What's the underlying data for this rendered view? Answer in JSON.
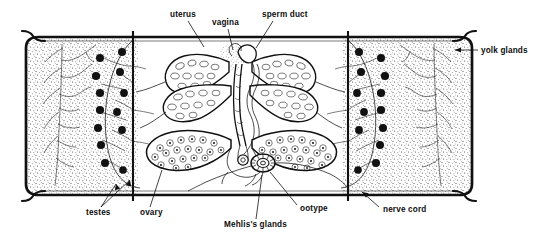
{
  "figure": {
    "background_color": "#ffffff",
    "ink_color": "#111111",
    "stipple_color": "#333333",
    "width": 546,
    "height": 236
  },
  "labels": [
    {
      "id": "uterus",
      "text": "uterus",
      "x": 170,
      "y": 17,
      "anchor": "start"
    },
    {
      "id": "vagina",
      "text": "vagina",
      "x": 212,
      "y": 25,
      "anchor": "start"
    },
    {
      "id": "sperm-duct",
      "text": "sperm duct",
      "x": 262,
      "y": 17,
      "anchor": "start"
    },
    {
      "id": "yolk-glands",
      "text": "yolk glands",
      "x": 481,
      "y": 53,
      "anchor": "start"
    },
    {
      "id": "testes",
      "text": "testes",
      "x": 86,
      "y": 215,
      "anchor": "start"
    },
    {
      "id": "ovary",
      "text": "ovary",
      "x": 140,
      "y": 215,
      "anchor": "start"
    },
    {
      "id": "mehliss-glands",
      "text": "Mehlis's glands",
      "x": 224,
      "y": 227,
      "anchor": "start"
    },
    {
      "id": "ootype",
      "text": "ootype",
      "x": 300,
      "y": 211,
      "anchor": "start"
    },
    {
      "id": "nerve-cord",
      "text": "nerve cord",
      "x": 383,
      "y": 212,
      "anchor": "start"
    }
  ],
  "structures": {
    "body_wall": {
      "name": "body wall outline",
      "stroke_width": 2.6
    },
    "yolk_left": {
      "name": "left yolk gland field",
      "stipple": true
    },
    "yolk_right": {
      "name": "right yolk gland field",
      "stipple": true
    },
    "nerve_cord_left": {
      "name": "left longitudinal nerve cord",
      "x": 133
    },
    "nerve_cord_right": {
      "name": "right longitudinal nerve cord",
      "x": 348
    },
    "testes_left_count": 13,
    "testes_right_count": 13,
    "uterus": {
      "name": "uterus",
      "lobes": 4,
      "contents": "eggs"
    },
    "ovary": {
      "name": "ovary",
      "lobes": 2,
      "contents": "oocytes"
    },
    "ootype": {
      "name": "ootype",
      "shape": "radially striated oval"
    },
    "vagina": {
      "name": "vagina"
    },
    "sperm_duct": {
      "name": "sperm duct / vas deferens"
    },
    "genital_atrium": {
      "name": "genital atrium",
      "stipple": true
    }
  }
}
